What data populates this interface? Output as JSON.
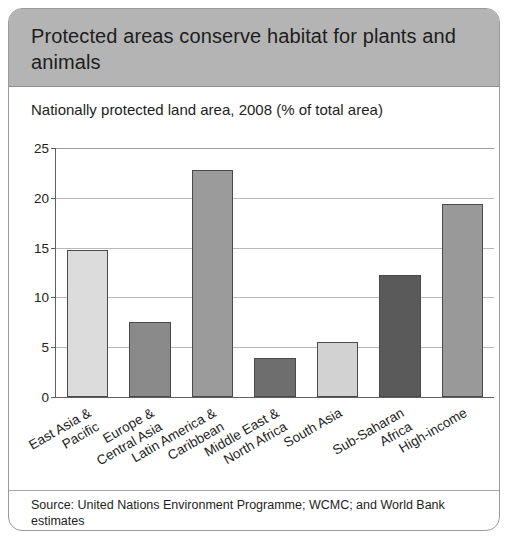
{
  "header": {
    "title": "Protected areas conserve habitat for plants and animals"
  },
  "source": {
    "text": "Source: United Nations Environment Programme; WCMC; and World Bank estimates"
  },
  "chart_data": {
    "type": "bar",
    "title": "Nationally protected land area, 2008 (% of total area)",
    "xlabel": "",
    "ylabel": "",
    "ylim": [
      0,
      25
    ],
    "yticks": [
      0,
      5,
      10,
      15,
      20,
      25
    ],
    "grid": true,
    "legend": "none",
    "categories": [
      "East Asia & Pacific",
      "Europe & Central Asia",
      "Latin America & Caribbean",
      "Middle East & North Africa",
      "South Asia",
      "Sub-Saharan Africa",
      "High-income"
    ],
    "category_lines": [
      [
        "East Asia &",
        "Pacific"
      ],
      [
        "Europe &",
        "Central Asia"
      ],
      [
        "Latin America &",
        "Caribbean"
      ],
      [
        "Middle East &",
        "North Africa"
      ],
      [
        "South Asia"
      ],
      [
        "Sub-Saharan",
        "Africa"
      ],
      [
        "High-income"
      ]
    ],
    "values": [
      14.8,
      7.5,
      22.8,
      3.9,
      5.5,
      12.3,
      19.4
    ],
    "bar_colors": [
      "#dcdcdc",
      "#8a8a8a",
      "#9b9b9b",
      "#6e6e6e",
      "#d2d2d2",
      "#5a5a5a",
      "#999999"
    ],
    "bar_edge_color": "#4a4a4a"
  },
  "colors": {
    "header_band": "#b4b4b4",
    "card_border": "#9a9a9a",
    "axis": "#5f5f5f",
    "gridline": "#b9b9b9",
    "text": "#1d1d1d"
  }
}
